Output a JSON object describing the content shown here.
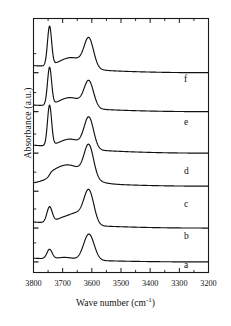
{
  "figure": {
    "background": "#ffffff",
    "line_color": "#111111",
    "axis_color": "#1a1a1a"
  },
  "axes": {
    "x_label_text": "Wave number (cm",
    "x_label_sup": "-1",
    "x_label_close": ")",
    "y_label": "Absorbance (a.u.)",
    "x_ticks": [
      "3800",
      "3700",
      "3600",
      "3500",
      "3400",
      "3300",
      "3200"
    ],
    "x_minor_per_interval": 1,
    "y_ticks_visible": true
  },
  "curve_labels": [
    {
      "id": "f",
      "label": "f"
    },
    {
      "id": "e",
      "label": "e"
    },
    {
      "id": "d",
      "label": "d"
    },
    {
      "id": "c",
      "label": "c"
    },
    {
      "id": "b",
      "label": "b"
    },
    {
      "id": "a",
      "label": "a"
    }
  ],
  "chart_data": {
    "type": "line",
    "title": "",
    "xlabel": "Wave number (cm-1)",
    "ylabel": "Absorbance (a.u.)",
    "xlim": [
      3800,
      3200
    ],
    "x_reversed": true,
    "ylim": [
      0,
      6
    ],
    "y_units": "arbitrary (offset stacked)",
    "grid": false,
    "legend": "inline-right-labels",
    "peaks_common": [
      {
        "wavenumber": 3745,
        "assignment": "isolated silanol / terminal OH"
      },
      {
        "wavenumber": 3660,
        "assignment": "bridging OH (broad)"
      },
      {
        "wavenumber": 3610,
        "assignment": "acidic bridging OH"
      }
    ],
    "series": [
      {
        "name": "a",
        "baseline_offset": 0.25,
        "peaks": [
          {
            "x": 3745,
            "height": 0.22,
            "width": 9,
            "shape": "sharp"
          },
          {
            "x": 3690,
            "height": 0.05,
            "width": 28,
            "shape": "shoulder"
          },
          {
            "x": 3610,
            "height": 0.62,
            "width": 18,
            "shape": "medium"
          }
        ],
        "tail_slope": 0.16
      },
      {
        "name": "b",
        "baseline_offset": 1.05,
        "peaks": [
          {
            "x": 3745,
            "height": 0.36,
            "width": 9,
            "shape": "sharp"
          },
          {
            "x": 3690,
            "height": 0.16,
            "width": 30,
            "shape": "shoulder"
          },
          {
            "x": 3648,
            "height": 0.2,
            "width": 22,
            "shape": "shoulder"
          },
          {
            "x": 3610,
            "height": 0.8,
            "width": 17,
            "shape": "strong"
          }
        ],
        "tail_slope": 0.26
      },
      {
        "name": "c",
        "baseline_offset": 1.92,
        "peaks": [
          {
            "x": 3745,
            "height": 0.12,
            "width": 14,
            "shape": "step"
          },
          {
            "x": 3680,
            "height": 0.4,
            "width": 55,
            "shape": "broad"
          },
          {
            "x": 3610,
            "height": 0.74,
            "width": 16,
            "shape": "medium"
          }
        ],
        "tail_slope": 0.3
      },
      {
        "name": "d",
        "baseline_offset": 2.82,
        "peaks": [
          {
            "x": 3745,
            "height": 0.95,
            "width": 7,
            "shape": "very-sharp"
          },
          {
            "x": 3672,
            "height": 0.22,
            "width": 38,
            "shape": "broad"
          },
          {
            "x": 3610,
            "height": 0.72,
            "width": 16,
            "shape": "medium"
          }
        ],
        "tail_slope": 0.34
      },
      {
        "name": "e",
        "baseline_offset": 3.8,
        "peaks": [
          {
            "x": 3745,
            "height": 0.88,
            "width": 7,
            "shape": "very-sharp"
          },
          {
            "x": 3672,
            "height": 0.24,
            "width": 40,
            "shape": "broad"
          },
          {
            "x": 3610,
            "height": 0.6,
            "width": 16,
            "shape": "medium"
          }
        ],
        "tail_slope": 0.28
      },
      {
        "name": "f",
        "baseline_offset": 4.72,
        "peaks": [
          {
            "x": 3745,
            "height": 0.92,
            "width": 7,
            "shape": "very-sharp"
          },
          {
            "x": 3668,
            "height": 0.26,
            "width": 42,
            "shape": "broad"
          },
          {
            "x": 3610,
            "height": 0.66,
            "width": 16,
            "shape": "medium"
          }
        ],
        "tail_slope": 0.3
      }
    ]
  }
}
